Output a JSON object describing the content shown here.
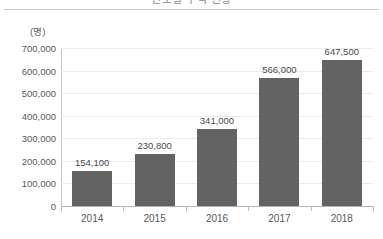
{
  "title": "연도별 누적 현황",
  "unit_label": "(명)",
  "chart_data": {
    "type": "bar",
    "title": "연도별 누적 현황",
    "categories": [
      "2014",
      "2015",
      "2016",
      "2017",
      "2018"
    ],
    "values": [
      154100,
      230800,
      341000,
      566000,
      647500
    ],
    "value_labels": [
      "154,100",
      "230,800",
      "341,000",
      "566,000",
      "647,500"
    ],
    "xlabel": "",
    "ylabel": "(명)",
    "ylim": [
      0,
      700000
    ],
    "ytick_values": [
      0,
      100000,
      200000,
      300000,
      400000,
      500000,
      600000,
      700000
    ],
    "ytick_labels": [
      "0",
      "100,000",
      "200,000",
      "300,000",
      "400,000",
      "500,000",
      "600,000",
      "700,000"
    ],
    "grid": true,
    "legend": "none",
    "bar_color": "#636363",
    "grid_color": "#ebebeb",
    "axis_color": "#b4b4b4",
    "text_color": "#595959"
  }
}
